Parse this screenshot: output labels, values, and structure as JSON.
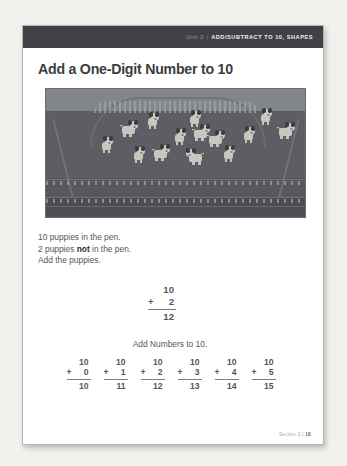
{
  "header": {
    "unit_label": "Unit 2",
    "separator": "|",
    "unit_title": "ADD/SUBTRACT TO 10, SHAPES",
    "band_color": "#3f4145"
  },
  "lesson": {
    "title": "Add a One-Digit Number to 10"
  },
  "photo": {
    "alt_name": "puppies-in-pen-photo",
    "puppy_count_visible": 14
  },
  "prose": {
    "line1": "10 puppies in the pen.",
    "line2_before": "2 puppies ",
    "line2_bold": "not",
    "line2_after": " in the pen.",
    "line3": "Add the puppies."
  },
  "worked_example": {
    "addend1": "10",
    "operator": "+",
    "addend2": "2",
    "sum": "12"
  },
  "practice": {
    "heading": "Add Numbers to 10.",
    "problems": [
      {
        "addend1": "10",
        "operator": "+",
        "addend2": "0",
        "sum": "10"
      },
      {
        "addend1": "10",
        "operator": "+",
        "addend2": "1",
        "sum": "11"
      },
      {
        "addend1": "10",
        "operator": "+",
        "addend2": "2",
        "sum": "12"
      },
      {
        "addend1": "10",
        "operator": "+",
        "addend2": "3",
        "sum": "13"
      },
      {
        "addend1": "10",
        "operator": "+",
        "addend2": "4",
        "sum": "14"
      },
      {
        "addend1": "10",
        "operator": "+",
        "addend2": "5",
        "sum": "15"
      }
    ]
  },
  "footer": {
    "section_label": "Section 3",
    "separator": "|",
    "page_number": "18"
  }
}
